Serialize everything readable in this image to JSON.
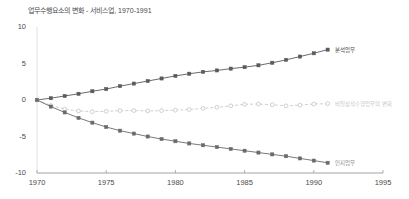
{
  "chart_data": {
    "type": "line",
    "title": "업무수행요소의 변화 - 서비스업, 1970-1991",
    "xlabel": "",
    "ylabel": "",
    "xlim": [
      1970,
      1995
    ],
    "ylim": [
      -10,
      10
    ],
    "grid": false,
    "legend_position": "right-of-line-ends",
    "xticks": [
      "1970",
      "1975",
      "1980",
      "1985",
      "1990",
      "1995"
    ],
    "xtick_values": [
      1970,
      1975,
      1980,
      1985,
      1990,
      1995
    ],
    "yticks": [
      "10",
      "5",
      "0",
      "-5",
      "-10"
    ],
    "ytick_values": [
      10,
      5,
      0,
      -5,
      -10
    ],
    "x": [
      1970,
      1971,
      1972,
      1973,
      1974,
      1975,
      1976,
      1977,
      1978,
      1979,
      1980,
      1981,
      1982,
      1983,
      1984,
      1985,
      1986,
      1987,
      1988,
      1989,
      1990,
      1991
    ],
    "series": [
      {
        "name": "비일상적 분석업무",
        "label": "분석업무",
        "color": "#5a5a5a",
        "marker": "square",
        "linestyle": "solid",
        "label_x": 1991.4,
        "label_y": 6.9,
        "values": [
          0,
          0.25,
          0.55,
          0.85,
          1.2,
          1.5,
          1.9,
          2.25,
          2.6,
          2.95,
          3.3,
          3.6,
          3.85,
          4.05,
          4.3,
          4.5,
          4.75,
          5.1,
          5.5,
          5.95,
          6.4,
          6.9
        ]
      },
      {
        "name": "비일상적 상호작용업무",
        "label": "비일상적수행업무의 변화",
        "color": "#c4c4c4",
        "marker": "circle",
        "linestyle": "dashed",
        "label_x": 1991.4,
        "label_y": -0.5,
        "values": [
          0,
          -0.75,
          -1.25,
          -1.5,
          -1.6,
          -1.55,
          -1.45,
          -1.45,
          -1.5,
          -1.45,
          -1.4,
          -1.3,
          -1.15,
          -1.0,
          -0.8,
          -0.6,
          -0.55,
          -0.65,
          -0.8,
          -0.7,
          -0.55,
          -0.5
        ]
      },
      {
        "name": "일상적 업무",
        "label": "인지업무",
        "color": "#6a6a6a",
        "marker": "square",
        "linestyle": "solid",
        "label_x": 1991.4,
        "label_y": -8.6,
        "values": [
          0,
          -0.9,
          -1.7,
          -2.45,
          -3.1,
          -3.7,
          -4.2,
          -4.6,
          -5.0,
          -5.35,
          -5.65,
          -5.95,
          -6.2,
          -6.45,
          -6.7,
          -6.95,
          -7.2,
          -7.45,
          -7.7,
          -8.0,
          -8.3,
          -8.6
        ]
      }
    ]
  }
}
